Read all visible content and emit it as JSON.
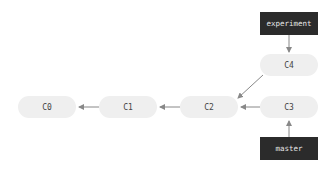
{
  "diagram": {
    "type": "git-commit-graph",
    "commits": [
      {
        "id": "C0",
        "label": "C0"
      },
      {
        "id": "C1",
        "label": "C1"
      },
      {
        "id": "C2",
        "label": "C2"
      },
      {
        "id": "C3",
        "label": "C3"
      },
      {
        "id": "C4",
        "label": "C4"
      }
    ],
    "branches": [
      {
        "id": "experiment",
        "label": "experiment",
        "points_to": "C4"
      },
      {
        "id": "master",
        "label": "master",
        "points_to": "C3"
      }
    ],
    "edges": [
      {
        "from": "C1",
        "to": "C0"
      },
      {
        "from": "C2",
        "to": "C1"
      },
      {
        "from": "C3",
        "to": "C2"
      },
      {
        "from": "C4",
        "to": "C2"
      },
      {
        "from": "experiment",
        "to": "C4"
      },
      {
        "from": "master",
        "to": "C3"
      }
    ],
    "colors": {
      "commit_fill": "#efefef",
      "commit_text": "#444444",
      "branch_fill": "#2b2b2b",
      "branch_text": "#e8e8e8",
      "arrow": "#888888"
    }
  }
}
